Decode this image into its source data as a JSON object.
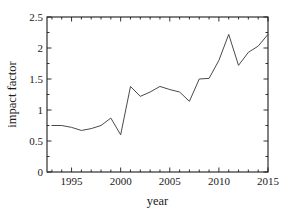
{
  "chart_data": {
    "type": "line",
    "title": "",
    "xlabel": "year",
    "ylabel": "impact factor",
    "xlim": [
      1992.5,
      2015
    ],
    "ylim": [
      0,
      2.5
    ],
    "grid": false,
    "legend": null,
    "xticks": [
      1995,
      2000,
      2005,
      2010,
      2015
    ],
    "xtick_labels": [
      "1995",
      "2000",
      "2005",
      "2010",
      "2015"
    ],
    "yticks": [
      0,
      0.5,
      1,
      1.5,
      2,
      2.5
    ],
    "ytick_labels": [
      "0",
      "0.5",
      "1",
      "1.5",
      "2",
      "2.5"
    ],
    "x": [
      1993,
      1994,
      1995,
      1996,
      1997,
      1998,
      1999,
      2000,
      2001,
      2002,
      2003,
      2004,
      2005,
      2006,
      2007,
      2008,
      2009,
      2010,
      2011,
      2012,
      2013,
      2014,
      2015
    ],
    "values": [
      0.75,
      0.75,
      0.72,
      0.67,
      0.7,
      0.75,
      0.87,
      0.6,
      1.38,
      1.22,
      1.29,
      1.38,
      1.33,
      1.29,
      1.14,
      1.5,
      1.51,
      1.8,
      2.22,
      1.72,
      1.93,
      2.03,
      2.22
    ],
    "series": [
      {
        "name": "impact factor",
        "color": "#4a4a4a",
        "values": [
          0.75,
          0.75,
          0.72,
          0.67,
          0.7,
          0.75,
          0.87,
          0.6,
          1.38,
          1.22,
          1.29,
          1.38,
          1.33,
          1.29,
          1.14,
          1.5,
          1.51,
          1.8,
          2.22,
          1.72,
          1.93,
          2.03,
          2.22
        ]
      }
    ]
  },
  "figure": {
    "background": "#ffffff",
    "axis_color": "#1c1c1c",
    "line_color": "#4a4a4a"
  }
}
